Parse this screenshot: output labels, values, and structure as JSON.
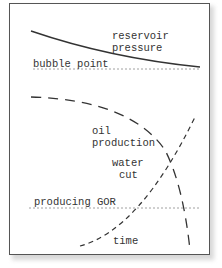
{
  "diagram": {
    "labels": {
      "reservoir_pressure_1": "reservoir",
      "reservoir_pressure_2": "pressure",
      "bubble_point": "bubble point",
      "oil_production_1": "oil",
      "oil_production_2": "production",
      "water_cut_1": "water",
      "water_cut_2": "cut",
      "producing_gor": "producing GOR",
      "time": "time"
    },
    "colors": {
      "line": "#333333",
      "reference_line": "#888888",
      "frame": "#555555"
    }
  }
}
